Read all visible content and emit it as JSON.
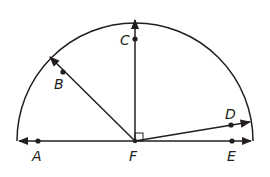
{
  "diagram": {
    "center": {
      "label": "F",
      "x": 135,
      "y": 141
    },
    "radius": 118,
    "stroke_color": "#231f20",
    "points": [
      {
        "label": "A",
        "x": 38,
        "y": 141
      },
      {
        "label": "B",
        "x": 63,
        "y": 72
      },
      {
        "label": "C",
        "x": 135,
        "y": 39
      },
      {
        "label": "D",
        "x": 231,
        "y": 126
      },
      {
        "label": "E",
        "x": 232,
        "y": 141
      },
      {
        "label": "F",
        "x": 135,
        "y": 141
      }
    ],
    "rays": [
      "FA",
      "FB",
      "FC",
      "FD",
      "FE"
    ],
    "right_angle": "CFE"
  },
  "labels": {
    "A": "A",
    "B": "B",
    "C": "C",
    "D": "D",
    "E": "E",
    "F": "F"
  }
}
